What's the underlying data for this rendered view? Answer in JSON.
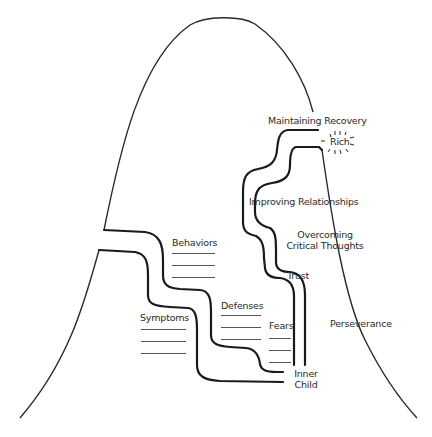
{
  "diagram": {
    "title": "",
    "labels": {
      "maintaining_recovery": "Maintaining Recovery",
      "rich": "Rich",
      "improving_relationships": "Improving Relationships",
      "overcoming_line1": "Overcoming",
      "overcoming_line2": "Critical Thoughts",
      "trust": "Trust",
      "perseverance": "Perseverance",
      "behaviors": "Behaviors",
      "defenses": "Defenses",
      "symptoms": "Symptoms",
      "fears": "Fears",
      "inner_line1": "Inner",
      "inner_line2": "Child"
    },
    "blank_line_groups": {
      "behaviors": 3,
      "defenses": 3,
      "symptoms": 3,
      "fears": 3
    },
    "colors": {
      "ink": "#2a2a2a",
      "background": "#ffffff"
    }
  }
}
